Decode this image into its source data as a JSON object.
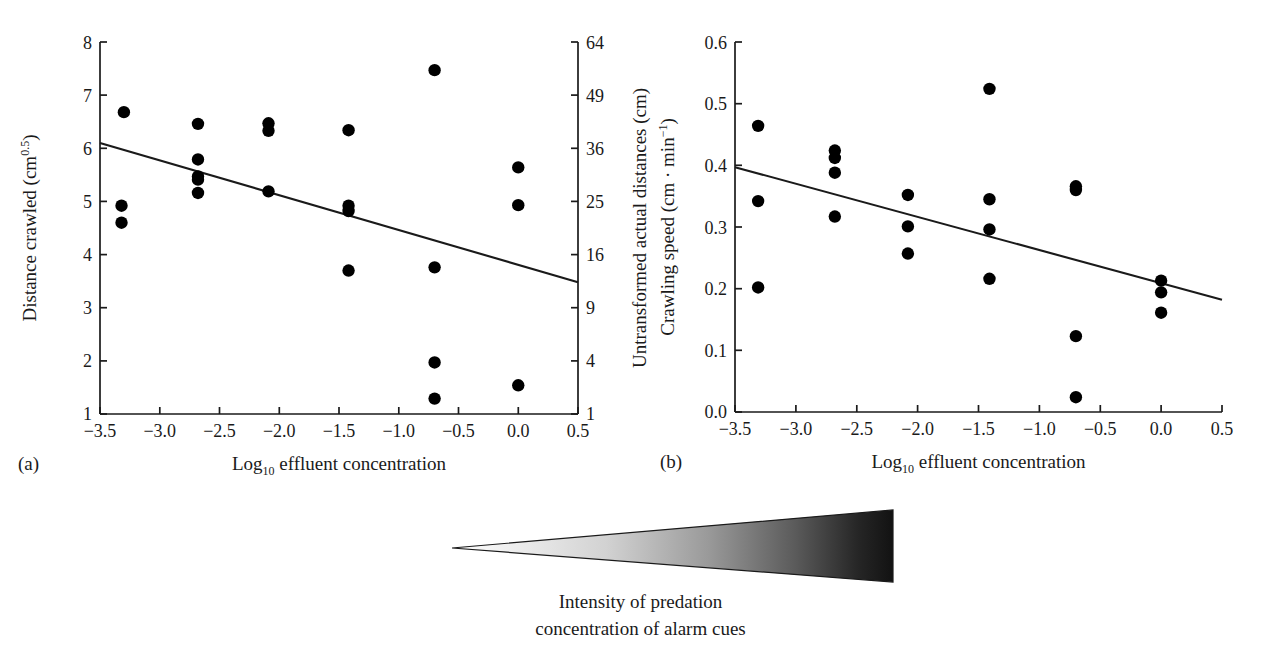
{
  "figure": {
    "background_color": "#ffffff",
    "ink_color": "#1a1a1a",
    "marker_color": "#000000"
  },
  "panel_a": {
    "letter": "(a)",
    "xlabel_pre": "Log",
    "xlabel_sub": "10",
    "xlabel_post": " effluent concentration",
    "ylabel_left_pre": "Distance crawled (cm",
    "ylabel_left_sup": "0.5",
    "ylabel_left_post": ")",
    "ylabel_right": "Untransformed actual distances (cm)",
    "x_ticks": [
      "−3.5",
      "−3.0",
      "−2.5",
      "−2.0",
      "−1.5",
      "−1.0",
      "−0.5",
      "0.0",
      "0.5"
    ],
    "y_ticks_left": [
      "8",
      "7",
      "6",
      "5",
      "4",
      "3",
      "2",
      "1"
    ],
    "y_ticks_right": [
      "64",
      "49",
      "36",
      "25",
      "16",
      "9",
      "4",
      "1"
    ]
  },
  "panel_b": {
    "letter": "(b)",
    "xlabel_pre": "Log",
    "xlabel_sub": "10",
    "xlabel_post": " effluent concentration",
    "ylabel_pre": "Crawling speed (cm · min",
    "ylabel_sup": "−1",
    "ylabel_post": ")",
    "x_ticks": [
      "−3.5",
      "−3.0",
      "−2.5",
      "−2.0",
      "−1.5",
      "−1.0",
      "−0.5",
      "0.0",
      "0.5"
    ],
    "y_ticks": [
      "0.6",
      "0.5",
      "0.4",
      "0.3",
      "0.2",
      "0.1",
      "0.0"
    ]
  },
  "wedge": {
    "caption_line_1": "Intensity of predation",
    "caption_line_2": "concentration of alarm cues",
    "gradient_light": "#f2f2f2",
    "gradient_dark": "#141414"
  },
  "chart_data": [
    {
      "id": "panel-a",
      "type": "scatter",
      "title": "",
      "panel_label": "(a)",
      "xlabel": "Log10 effluent concentration",
      "ylabel": "Distance crawled (cm^0.5)",
      "y2label": "Untransformed actual distances (cm)",
      "xlim": [
        -3.5,
        0.5
      ],
      "ylim": [
        1,
        8
      ],
      "y2lim": [
        1,
        64
      ],
      "y2_note": "secondary axis is the square of the primary axis values",
      "xticks": [
        -3.5,
        -3.0,
        -2.5,
        -2.0,
        -1.5,
        -1.0,
        -0.5,
        0.0,
        0.5
      ],
      "yticks": [
        1,
        2,
        3,
        4,
        5,
        6,
        7,
        8
      ],
      "y2ticks": [
        1,
        4,
        9,
        16,
        25,
        36,
        49,
        64
      ],
      "grid": false,
      "legend": "none",
      "points": [
        {
          "x": -3.3,
          "y": 6.68
        },
        {
          "x": -3.32,
          "y": 4.92
        },
        {
          "x": -3.32,
          "y": 4.6
        },
        {
          "x": -2.68,
          "y": 6.46
        },
        {
          "x": -2.68,
          "y": 5.79
        },
        {
          "x": -2.68,
          "y": 5.47
        },
        {
          "x": -2.68,
          "y": 5.41
        },
        {
          "x": -2.68,
          "y": 5.16
        },
        {
          "x": -2.09,
          "y": 6.47
        },
        {
          "x": -2.09,
          "y": 6.33
        },
        {
          "x": -2.09,
          "y": 5.19
        },
        {
          "x": -1.42,
          "y": 6.34
        },
        {
          "x": -1.42,
          "y": 4.92
        },
        {
          "x": -1.42,
          "y": 4.82
        },
        {
          "x": -1.42,
          "y": 3.7
        },
        {
          "x": -0.7,
          "y": 7.47
        },
        {
          "x": -0.7,
          "y": 3.76
        },
        {
          "x": -0.7,
          "y": 1.97
        },
        {
          "x": -0.7,
          "y": 1.29
        },
        {
          "x": 0.0,
          "y": 5.64
        },
        {
          "x": 0.0,
          "y": 4.93
        },
        {
          "x": 0.0,
          "y": 1.54
        }
      ],
      "regression_line": {
        "x": [
          -3.5,
          0.5
        ],
        "y": [
          6.1,
          3.48
        ]
      }
    },
    {
      "id": "panel-b",
      "type": "scatter",
      "title": "",
      "panel_label": "(b)",
      "xlabel": "Log10 effluent concentration",
      "ylabel": "Crawling speed (cm · min^-1)",
      "xlim": [
        -3.5,
        0.5
      ],
      "ylim": [
        0.0,
        0.6
      ],
      "xticks": [
        -3.5,
        -3.0,
        -2.5,
        -2.0,
        -1.5,
        -1.0,
        -0.5,
        0.0,
        0.5
      ],
      "yticks": [
        0.0,
        0.1,
        0.2,
        0.3,
        0.4,
        0.5,
        0.6
      ],
      "grid": false,
      "legend": "none",
      "points": [
        {
          "x": -3.31,
          "y": 0.464
        },
        {
          "x": -3.31,
          "y": 0.342
        },
        {
          "x": -3.31,
          "y": 0.202
        },
        {
          "x": -2.68,
          "y": 0.424
        },
        {
          "x": -2.68,
          "y": 0.412
        },
        {
          "x": -2.68,
          "y": 0.388
        },
        {
          "x": -2.68,
          "y": 0.317
        },
        {
          "x": -2.08,
          "y": 0.352
        },
        {
          "x": -2.08,
          "y": 0.301
        },
        {
          "x": -2.08,
          "y": 0.257
        },
        {
          "x": -1.41,
          "y": 0.524
        },
        {
          "x": -1.41,
          "y": 0.345
        },
        {
          "x": -1.41,
          "y": 0.296
        },
        {
          "x": -1.41,
          "y": 0.216
        },
        {
          "x": -0.7,
          "y": 0.366
        },
        {
          "x": -0.7,
          "y": 0.36
        },
        {
          "x": -0.7,
          "y": 0.123
        },
        {
          "x": -0.7,
          "y": 0.024
        },
        {
          "x": 0.0,
          "y": 0.213
        },
        {
          "x": 0.0,
          "y": 0.194
        },
        {
          "x": 0.0,
          "y": 0.161
        }
      ],
      "regression_line": {
        "x": [
          -3.5,
          0.5
        ],
        "y": [
          0.397,
          0.182
        ]
      }
    }
  ]
}
